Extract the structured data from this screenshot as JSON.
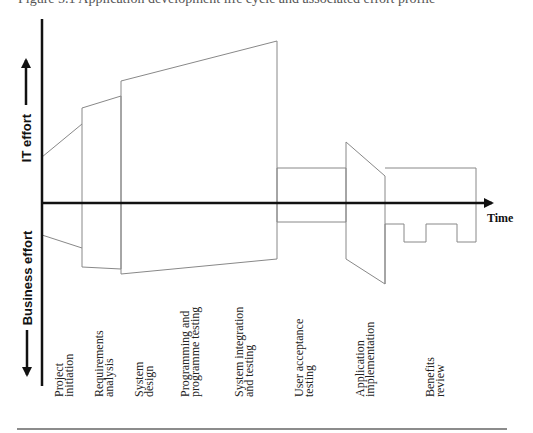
{
  "figure": {
    "caption_fragment": "Figure 5.1 Application development life cycle and associated effort profile",
    "y_axis": {
      "positive_label": "IT effort",
      "negative_label": "Business effort",
      "up_arrow_icon": "arrow-up-icon",
      "down_arrow_icon": "arrow-down-icon"
    },
    "x_axis": {
      "label": "Time",
      "arrow_icon": "arrow-right-icon"
    },
    "phases": [
      {
        "line1": "Project",
        "line2": "initiation"
      },
      {
        "line1": "Requirements",
        "line2": "analysis"
      },
      {
        "line1": "System",
        "line2": "design"
      },
      {
        "line1": "Programming and",
        "line2": "programme testing"
      },
      {
        "line1": "System integration",
        "line2": "and testing"
      },
      {
        "line1": "User acceptance",
        "line2": "testing"
      },
      {
        "line1": "Application",
        "line2": "implementation"
      },
      {
        "line1": "Benefits",
        "line2": "review"
      }
    ],
    "colors": {
      "axis": "#111111",
      "shape_outline": "#888888",
      "rule": "#666666"
    }
  }
}
